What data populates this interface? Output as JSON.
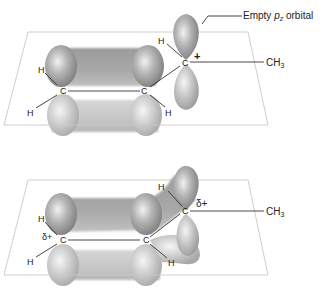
{
  "diagrams": [
    {
      "name": "localized-allyl-cation",
      "labels": {
        "callout": "Empty ",
        "callout_p": "p",
        "callout_sub": "z",
        "callout_tail": " orbital",
        "methyl": "CH",
        "methyl_sub": "3",
        "charge": "+",
        "c1": "C",
        "c2": "C",
        "c3": "C",
        "h1": "H",
        "h2": "H",
        "h3": "H",
        "h4": "H"
      }
    },
    {
      "name": "delocalized-allyl-cation",
      "labels": {
        "methyl": "CH",
        "methyl_sub": "3",
        "charge_c3": "δ+",
        "charge_c1": "δ+",
        "c1": "C",
        "c2": "C",
        "c3": "C",
        "h1": "H",
        "h2": "H",
        "h3": "H",
        "h4": "H"
      }
    }
  ],
  "colors": {
    "orbital_light": "#e8e8e8",
    "orbital_mid": "#a8a8a8",
    "orbital_dark": "#808080",
    "plane": "#c8c8c8",
    "bond": "#333333"
  }
}
